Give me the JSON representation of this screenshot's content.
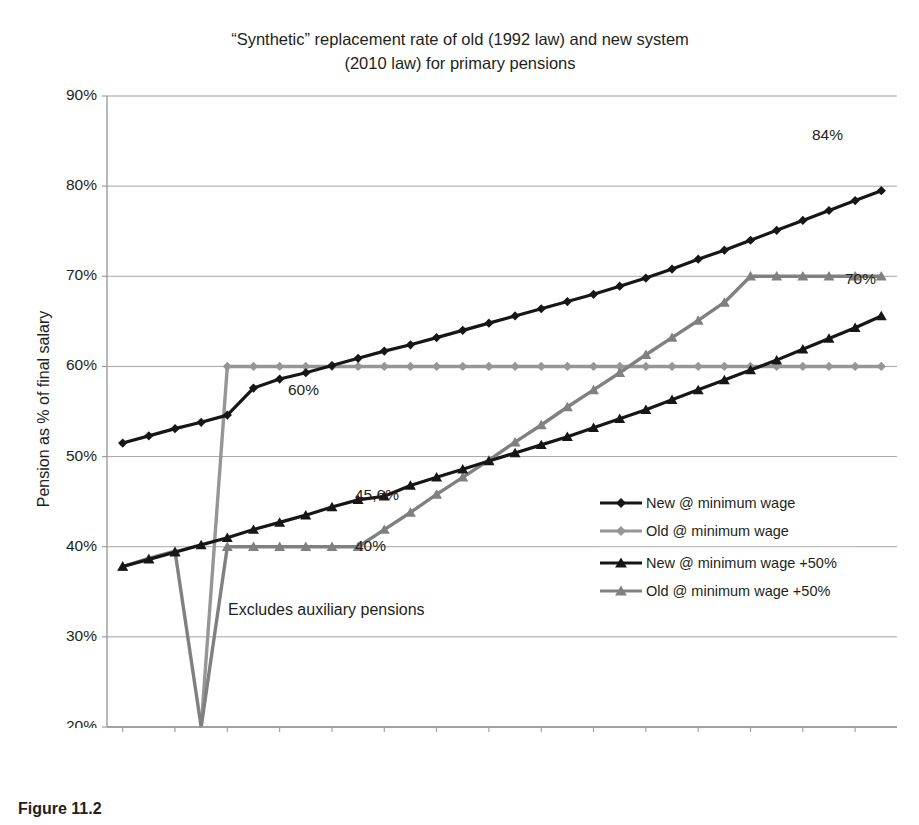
{
  "figure": {
    "title_line1": "“Synthetic” replacement rate of old (1992 law) and new system",
    "title_line2": "(2010 law) for primary pensions",
    "caption": "Figure 11.2"
  },
  "axes": {
    "ylabel": "Pension as % of final salary",
    "xlabel": "Years of contribution",
    "yticks": [
      "20%",
      "30%",
      "40%",
      "50%",
      "60%",
      "70%",
      "80%",
      "90%"
    ],
    "xticks": [
      "12",
      "14",
      "16",
      "18",
      "20",
      "22",
      "24",
      "26",
      "28",
      "30",
      "32",
      "34",
      "36",
      "38",
      "40"
    ]
  },
  "legend": {
    "items": [
      {
        "label": "New @ minimum wage",
        "color": "#161616",
        "marker": "diamond"
      },
      {
        "label": "Old @ minimum wage",
        "color": "#969696",
        "marker": "diamond"
      },
      {
        "label": "New @ minimum wage +50%",
        "color": "#161616",
        "marker": "triangle"
      },
      {
        "label": "Old @ minimum wage +50%",
        "color": "#808080",
        "marker": "triangle"
      }
    ]
  },
  "annotations": [
    {
      "text": "84%",
      "x": 812,
      "y": 126
    },
    {
      "text": "70%",
      "x": 845,
      "y": 270
    },
    {
      "text": "60%",
      "x": 288,
      "y": 381
    },
    {
      "text": "45,6%",
      "x": 355,
      "y": 486
    },
    {
      "text": "40%",
      "x": 355,
      "y": 537
    }
  ],
  "notes": [
    {
      "text": "Excludes auxiliary pensions",
      "x": 228,
      "y": 601
    }
  ],
  "colors": {
    "black_series": "#161616",
    "gray_series": "#969696",
    "gray_series_dark": "#808080",
    "gridline": "#a6a6a6",
    "frame": "#9c9c9c",
    "text": "#231f20",
    "background": "#ffffff"
  },
  "chart_data": {
    "type": "line",
    "title": "“Synthetic” replacement rate of old (1992 law) and new system (2010 law) for primary pensions",
    "xlabel": "Years of contribution",
    "ylabel": "Pension as % of final salary",
    "xlim": [
      11.4,
      41.6
    ],
    "ylim": [
      20,
      90
    ],
    "yticks": [
      20,
      30,
      40,
      50,
      60,
      70,
      80,
      90
    ],
    "xticks": [
      12,
      14,
      16,
      18,
      20,
      22,
      24,
      26,
      28,
      30,
      32,
      34,
      36,
      38,
      40
    ],
    "grid": "horizontal",
    "legend_position": "right-middle",
    "x": [
      12,
      13,
      14,
      15,
      16,
      17,
      18,
      19,
      20,
      21,
      22,
      23,
      24,
      25,
      26,
      27,
      28,
      29,
      30,
      31,
      32,
      33,
      34,
      35,
      36,
      37,
      38,
      39,
      40,
      41
    ],
    "series": [
      {
        "name": "New @ minimum wage",
        "color": "#161616",
        "marker": "diamond",
        "values": [
          51.5,
          52.3,
          53.1,
          53.8,
          54.6,
          57.6,
          58.6,
          59.3,
          60.1,
          60.9,
          61.7,
          62.4,
          63.2,
          64.0,
          64.8,
          65.6,
          66.4,
          67.2,
          68.0,
          68.9,
          69.8,
          70.8,
          71.9,
          72.9,
          74.0,
          75.1,
          76.2,
          77.3,
          78.4,
          79.5
        ],
        "label_end": "84%"
      },
      {
        "name": "Old @ minimum wage",
        "color": "#969696",
        "marker": "diamond",
        "values": [
          null,
          null,
          null,
          20.0,
          60.0,
          60.0,
          60.0,
          60.0,
          60.0,
          60.0,
          60.0,
          60.0,
          60.0,
          60.0,
          60.0,
          60.0,
          60.0,
          60.0,
          60.0,
          60.0,
          60.0,
          60.0,
          60.0,
          60.0,
          60.0,
          60.0,
          60.0,
          60.0,
          60.0,
          60.0
        ],
        "label_plateau": "60%"
      },
      {
        "name": "New @ minimum wage +50%",
        "color": "#161616",
        "marker": "triangle",
        "values": [
          37.8,
          38.6,
          39.4,
          40.2,
          41.0,
          41.9,
          42.7,
          43.5,
          44.4,
          45.2,
          45.6,
          46.8,
          47.7,
          48.6,
          49.5,
          50.4,
          51.3,
          52.2,
          53.2,
          54.2,
          55.2,
          56.3,
          57.4,
          58.5,
          59.6,
          60.7,
          61.9,
          63.1,
          64.3,
          65.6
        ],
        "label_mid": "45,6%"
      },
      {
        "name": "Old @ minimum wage +50%",
        "color": "#808080",
        "marker": "triangle",
        "values": [
          37.8,
          38.7,
          39.5,
          20.0,
          40.0,
          40.0,
          40.0,
          40.0,
          40.0,
          40.0,
          41.9,
          43.8,
          45.8,
          47.7,
          49.6,
          51.6,
          53.5,
          55.5,
          57.4,
          59.3,
          61.3,
          63.2,
          65.1,
          67.1,
          70.0,
          70.0,
          70.0,
          70.0,
          70.0,
          70.0
        ],
        "label_plateau": "40%",
        "label_end": "70%"
      }
    ],
    "endpoint_labels": {
      "new_min_wage": "84%",
      "old_plus50": "70%"
    },
    "note": "Excludes auxiliary pensions"
  }
}
